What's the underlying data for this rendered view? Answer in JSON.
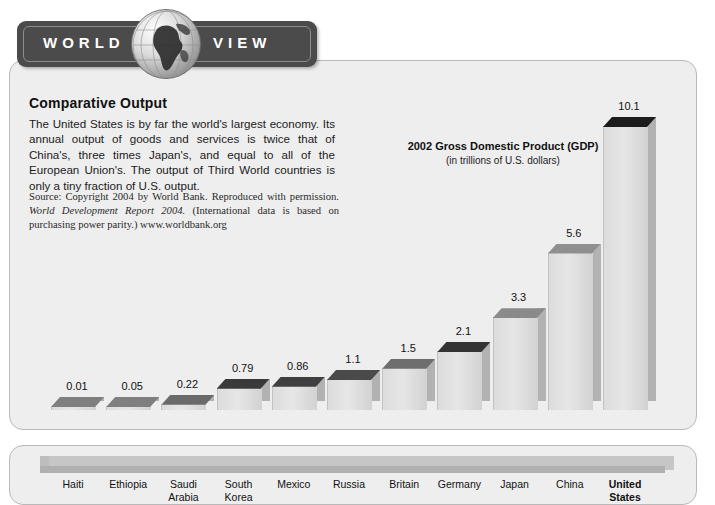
{
  "banner": {
    "word_left": "WORLD",
    "word_right": "VIEW",
    "globe_icon": "globe-icon"
  },
  "article": {
    "heading": "Comparative Output",
    "body": "The United States is by far the world's largest economy. Its annual output of goods and services is twice that of China's, three times Japan's, and equal to all of the European Union's. The output of Third World countries is only a tiny fraction of U.S. output.",
    "source_part1": "Source: Copyright 2004 by World Bank. Reproduced with permission. ",
    "source_italic": "World Development Report 2004.",
    "source_part2": " (International data is based on purchasing power parity.) www.worldbank.org"
  },
  "chart_data": {
    "type": "bar",
    "title": "2002 Gross Domestic Product (GDP)",
    "subtitle": "(in trillions of U.S. dollars)",
    "xlabel": "",
    "ylabel": "",
    "ylim": [
      0,
      10.1
    ],
    "grid": false,
    "legend": null,
    "categories": [
      "Haiti",
      "Ethiopia",
      "Saudi Arabia",
      "South Korea",
      "Mexico",
      "Russia",
      "Britain",
      "Germany",
      "Japan",
      "China",
      "United States"
    ],
    "value_labels": [
      "0.01",
      "0.05",
      "0.22",
      "0.79",
      "0.86",
      "1.1",
      "1.5",
      "2.1",
      "3.3",
      "5.6",
      "10.1"
    ],
    "values": [
      0.01,
      0.05,
      0.22,
      0.79,
      0.86,
      1.1,
      1.5,
      2.1,
      3.3,
      5.6,
      10.1
    ],
    "highlighted_category": "United States"
  },
  "colors": {
    "panel_background": "#eeeeee",
    "banner": "#4b4b4b",
    "bar_face": "#dcdcdc",
    "bar_top_dark": "#3a3a3a",
    "bar_top_mid": "#7d7d7d",
    "base": "#c6c6c6",
    "text": "#111111"
  }
}
